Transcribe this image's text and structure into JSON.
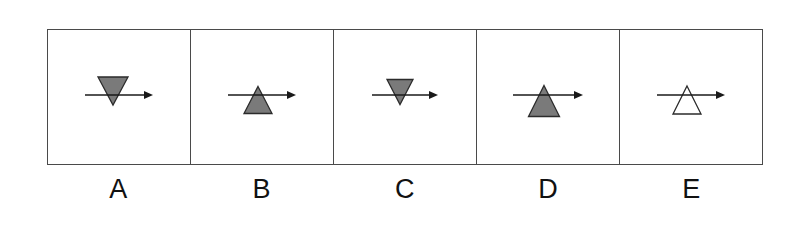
{
  "figure": {
    "name": "triangle-arrow-stimulus-row",
    "background_color": "#ffffff",
    "panel_border_color": "#4a4a4a",
    "arrow_color": "#1a1a1a",
    "triangle_fill_gray": "#7a7a7a",
    "triangle_outline": "#2b2b2b",
    "triangle_fill_white": "#ffffff",
    "cell_count": 5
  },
  "cells": [
    {
      "label": "A",
      "icon_name": "down-triangle-with-right-arrow",
      "triangle_direction": "down",
      "triangle_fill": "gray",
      "triangle_width": 30,
      "triangle_height": 28,
      "arrow_length": 68,
      "arrow_direction": "right",
      "triangle_offset_x": -6,
      "triangle_offset_y": -4
    },
    {
      "label": "B",
      "icon_name": "up-triangle-with-right-arrow",
      "triangle_direction": "up",
      "triangle_fill": "gray",
      "triangle_width": 28,
      "triangle_height": 27,
      "arrow_length": 68,
      "arrow_direction": "right",
      "triangle_offset_x": -4,
      "triangle_offset_y": 5
    },
    {
      "label": "C",
      "icon_name": "down-triangle-with-right-arrow",
      "triangle_direction": "down",
      "triangle_fill": "gray",
      "triangle_width": 26,
      "triangle_height": 25,
      "arrow_length": 66,
      "arrow_direction": "right",
      "triangle_offset_x": -5,
      "triangle_offset_y": -3
    },
    {
      "label": "D",
      "icon_name": "up-triangle-with-right-arrow",
      "triangle_direction": "up",
      "triangle_fill": "gray",
      "triangle_width": 31,
      "triangle_height": 31,
      "arrow_length": 70,
      "arrow_direction": "right",
      "triangle_offset_x": -4,
      "triangle_offset_y": 6
    },
    {
      "label": "E",
      "icon_name": "up-triangle-outline-with-right-arrow",
      "triangle_direction": "up",
      "triangle_fill": "white",
      "triangle_width": 28,
      "triangle_height": 28,
      "arrow_length": 68,
      "arrow_direction": "right",
      "triangle_offset_x": -4,
      "triangle_offset_y": 5
    }
  ]
}
